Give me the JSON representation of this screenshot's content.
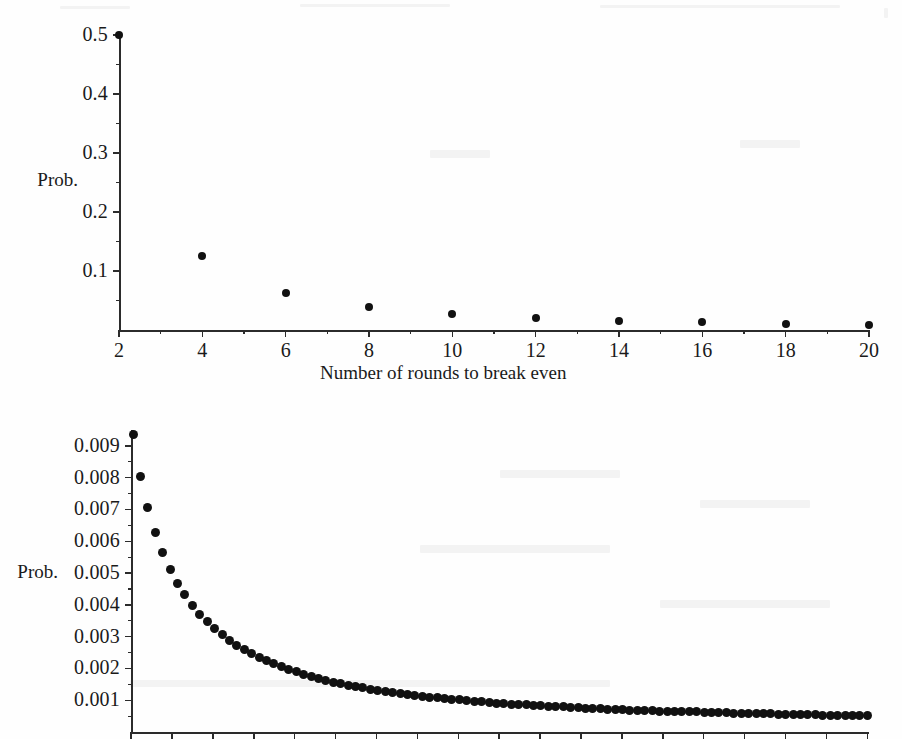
{
  "page": {
    "background": "#fefefe",
    "ink": "#1a1a1a",
    "dot_color": "#111111"
  },
  "charts": [
    {
      "id": "chart-top",
      "axis_label_y": "Prob.",
      "axis_label_x": "Number of rounds to break even",
      "y_ticks": [
        "0.1",
        "0.2",
        "0.3",
        "0.4",
        "0.5"
      ],
      "x_ticks": [
        "2",
        "4",
        "6",
        "8",
        "10",
        "12",
        "14",
        "16",
        "18",
        "20"
      ]
    },
    {
      "id": "chart-bottom",
      "axis_label_y": "Prob.",
      "axis_label_x": "",
      "y_ticks": [
        "0.001",
        "0.002",
        "0.003",
        "0.004",
        "0.005",
        "0.006",
        "0.007",
        "0.008",
        "0.009"
      ],
      "x_ticks": []
    }
  ],
  "chart_data": [
    {
      "id": "chart-top",
      "type": "scatter",
      "title": "",
      "xlabel": "Number of rounds to break even",
      "ylabel": "Prob.",
      "grid": false,
      "legend": null,
      "xlim": [
        2,
        20
      ],
      "ylim": [
        0,
        0.5
      ],
      "x_tick_labels": [
        "2",
        "4",
        "6",
        "8",
        "10",
        "12",
        "14",
        "16",
        "18",
        "20"
      ],
      "x_tick_values": [
        2,
        4,
        6,
        8,
        10,
        12,
        14,
        16,
        18,
        20
      ],
      "y_tick_labels": [
        "0.1",
        "0.2",
        "0.3",
        "0.4",
        "0.5"
      ],
      "y_tick_values": [
        0.1,
        0.2,
        0.3,
        0.4,
        0.5
      ],
      "y_minor_step": 0.05,
      "x_minor_step": 1,
      "x": [
        2,
        4,
        6,
        8,
        10,
        12,
        14,
        16,
        18,
        20
      ],
      "y": [
        0.5,
        0.125,
        0.0625,
        0.0391,
        0.0273,
        0.0205,
        0.0161,
        0.0131,
        0.0109,
        0.0093
      ],
      "marker": "filled-circle",
      "marker_size_px": 8
    },
    {
      "id": "chart-bottom",
      "type": "scatter",
      "title": "",
      "xlabel": "",
      "ylabel": "Prob.",
      "grid": false,
      "legend": null,
      "ylim": [
        0,
        0.0095
      ],
      "y_tick_labels": [
        "0.001",
        "0.002",
        "0.003",
        "0.004",
        "0.005",
        "0.006",
        "0.007",
        "0.008",
        "0.009"
      ],
      "y_tick_values": [
        0.001,
        0.002,
        0.003,
        0.004,
        0.005,
        0.006,
        0.007,
        0.008,
        0.009
      ],
      "y_minor_step": 0.0005,
      "note": "continuation tail of the same first-return distribution, x axis tick marks only (labels cropped off the bottom of the page)",
      "x_index_range": [
        20,
        218
      ],
      "x_index_step": 2,
      "y": [
        0.00937,
        0.00804,
        0.00705,
        0.00627,
        0.00564,
        0.00512,
        0.00468,
        0.00431,
        0.00399,
        0.00371,
        0.00347,
        0.00325,
        0.00306,
        0.00289,
        0.00273,
        0.00259,
        0.00246,
        0.00234,
        0.00224,
        0.00214,
        0.00205,
        0.00196,
        0.00189,
        0.00181,
        0.00175,
        0.00168,
        0.00163,
        0.00157,
        0.00152,
        0.00147,
        0.00143,
        0.00139,
        0.00135,
        0.00131,
        0.00127,
        0.00124,
        0.00121,
        0.00118,
        0.00115,
        0.00112,
        0.0011,
        0.00107,
        0.00105,
        0.00103,
        0.00101,
        0.00099,
        0.00097,
        0.00095,
        0.00093,
        0.00091,
        0.0009,
        0.00088,
        0.00087,
        0.00085,
        0.00084,
        0.00082,
        0.00081,
        0.0008,
        0.00079,
        0.00077,
        0.00076,
        0.00075,
        0.00074,
        0.00073,
        0.00072,
        0.00071,
        0.0007,
        0.00069,
        0.00069,
        0.00068,
        0.00067,
        0.00066,
        0.00065,
        0.00065,
        0.00064,
        0.00063,
        0.00063,
        0.00062,
        0.00061,
        0.00061,
        0.0006,
        0.00059,
        0.00059,
        0.00058,
        0.00058,
        0.00057,
        0.00057,
        0.00056,
        0.00056,
        0.00055,
        0.00055,
        0.00054,
        0.00054,
        0.00053,
        0.00053,
        0.00052,
        0.00052,
        0.00052,
        0.00051,
        0.00051
      ],
      "marker": "filled-circle",
      "marker_size_px": 9
    }
  ]
}
